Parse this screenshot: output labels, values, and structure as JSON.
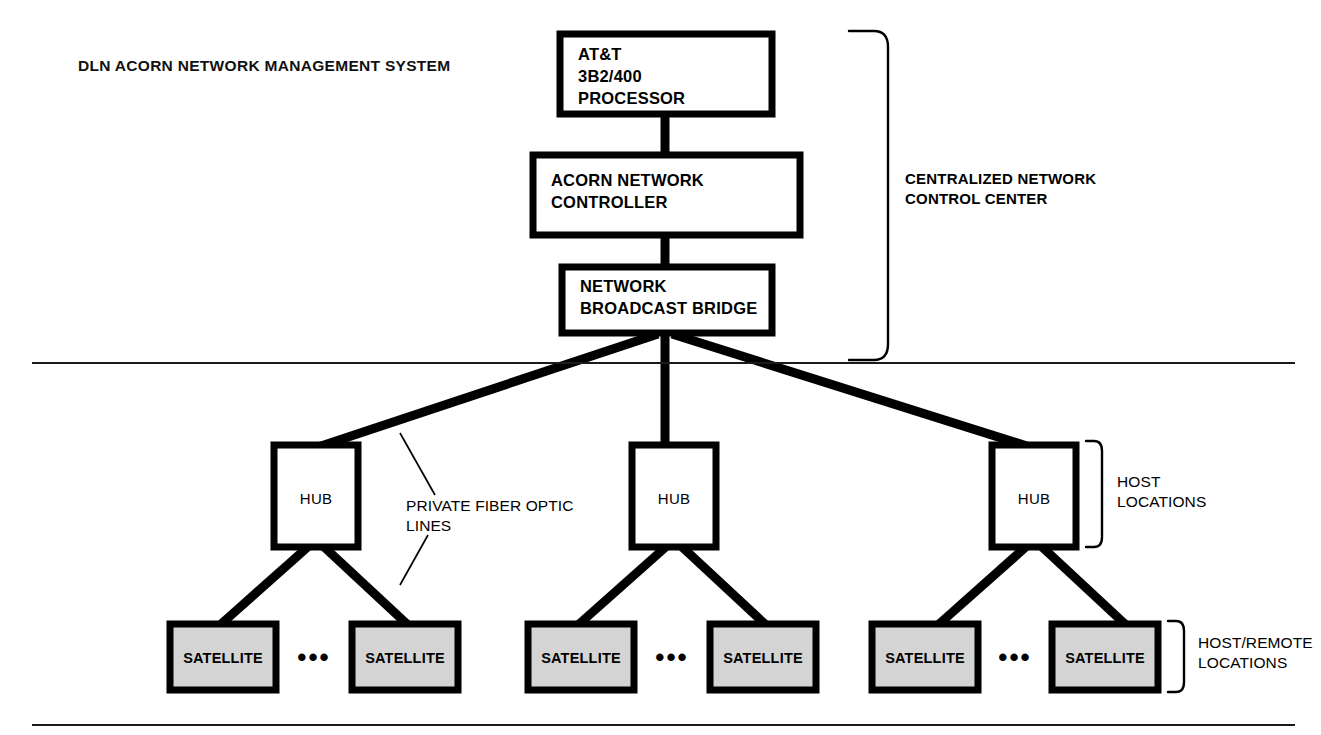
{
  "title": "DLN ACORN NETWORK MANAGEMENT SYSTEM",
  "nodes": {
    "processor": {
      "line1": "AT&T",
      "line2": "3B2/400",
      "line3": "PROCESSOR"
    },
    "controller": {
      "line1": "ACORN NETWORK",
      "line2": "CONTROLLER"
    },
    "bridge": {
      "line1": "NETWORK",
      "line2": "BROADCAST BRIDGE"
    }
  },
  "hubs": [
    {
      "label": "HUB"
    },
    {
      "label": "HUB"
    },
    {
      "label": "HUB"
    }
  ],
  "satellites": [
    {
      "label": "SATELLITE"
    },
    {
      "label": "SATELLITE"
    },
    {
      "label": "SATELLITE"
    },
    {
      "label": "SATELLITE"
    },
    {
      "label": "SATELLITE"
    },
    {
      "label": "SATELLITE"
    }
  ],
  "ellipses": [
    {
      "glyph": "•••"
    },
    {
      "glyph": "•••"
    },
    {
      "glyph": "•••"
    }
  ],
  "brackets": {
    "control_center": {
      "line1": "CENTRALIZED NETWORK",
      "line2": "CONTROL CENTER"
    },
    "host": {
      "line1": "HOST",
      "line2": "LOCATIONS"
    },
    "host_remote": {
      "line1": "HOST/REMOTE",
      "line2": "LOCATIONS"
    }
  },
  "annotations": {
    "fiber": {
      "line1": "PRIVATE FIBER OPTIC",
      "line2": "LINES"
    }
  },
  "colors": {
    "ink": "#000000",
    "paper": "#ffffff",
    "satellite_fill": "#d4d4d4",
    "divider": "#1a1a1a"
  }
}
